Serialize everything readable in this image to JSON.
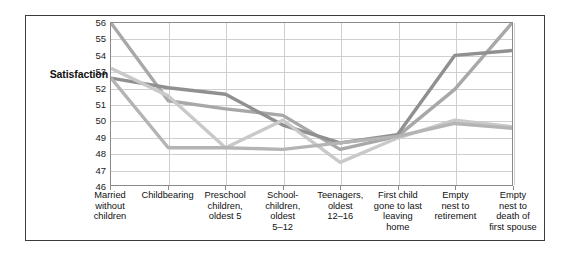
{
  "figure": {
    "background": "#ffffff",
    "frame_color": "#3b3b3b",
    "axis_color": "#8a8a8a",
    "grid_color": "#cfcfcf"
  },
  "axis": {
    "y_title": "Satisfaction",
    "y_ticks": [
      "56",
      "55",
      "54",
      "53",
      "52",
      "51",
      "50",
      "49",
      "48",
      "47",
      "46"
    ]
  },
  "chart_data": {
    "type": "line",
    "title": "",
    "xlabel": "",
    "ylabel": "Satisfaction",
    "ylim": [
      46,
      56
    ],
    "grid": true,
    "legend": "none",
    "categories": [
      "Married without children",
      "Childbearing",
      "Preschool children, oldest 5",
      "School-children, oldest 5–12",
      "Teenagers, oldest 12–16",
      "First child gone to last leaving home",
      "Empty nest to retirement",
      "Empty nest to death of first spouse"
    ],
    "categories_wrapped": [
      [
        "Married",
        "without",
        "children"
      ],
      [
        "Childbearing"
      ],
      [
        "Preschool",
        "children,",
        "oldest 5"
      ],
      [
        "School-",
        "children,",
        "oldest",
        "5–12"
      ],
      [
        "Teenagers,",
        "oldest",
        "12–16"
      ],
      [
        "First child",
        "gone to last",
        "leaving",
        "home"
      ],
      [
        "Empty",
        "nest to",
        "retirement"
      ],
      [
        "Empty",
        "nest to",
        "death of",
        "first spouse"
      ]
    ],
    "series": [
      {
        "name": "series-1",
        "color": "#a8a8a8",
        "values": [
          56.0,
          51.2,
          50.7,
          50.3,
          48.2,
          49.0,
          51.9,
          56.0
        ]
      },
      {
        "name": "series-2",
        "color": "#909090",
        "values": [
          52.6,
          52.0,
          51.6,
          49.7,
          48.6,
          49.1,
          54.0,
          54.3
        ]
      },
      {
        "name": "series-3",
        "color": "#c9c9c9",
        "values": [
          53.2,
          51.5,
          48.3,
          50.0,
          47.4,
          48.9,
          50.0,
          49.6
        ]
      },
      {
        "name": "series-4",
        "color": "#b4b4b4",
        "values": [
          52.6,
          48.3,
          48.3,
          48.2,
          48.6,
          49.0,
          49.8,
          49.5
        ]
      }
    ]
  }
}
